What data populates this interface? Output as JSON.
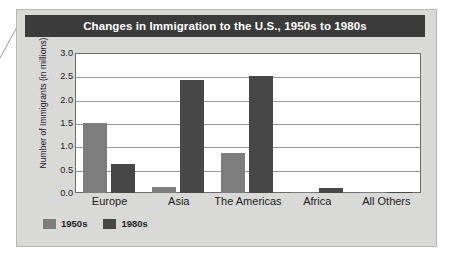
{
  "chart_data": {
    "type": "bar",
    "title": "Changes in Immigration to the U.S., 1950s to 1980s",
    "xlabel": "",
    "ylabel": "Number of Immigrants (in millions)",
    "categories": [
      "Europe",
      "Asia",
      "The Americas",
      "Africa",
      "All Others"
    ],
    "series": [
      {
        "name": "1950s",
        "color": "#7d7d7d",
        "values": [
          1.5,
          0.12,
          0.85,
          0.02,
          0.03
        ]
      },
      {
        "name": "1980s",
        "color": "#474747",
        "values": [
          0.62,
          2.42,
          2.5,
          0.1,
          0.03
        ]
      }
    ],
    "ylim": [
      0.0,
      3.0
    ],
    "ytick_step": 0.5,
    "ytick_labels": [
      "3.0",
      "2.5",
      "2.0",
      "1.5",
      "1.0",
      "0.5",
      "0.0"
    ],
    "grid": true,
    "legend_position": "bottom-left"
  },
  "colors": {
    "panel_background": "#d9d9d7",
    "title_bar_background": "#3b3b3b",
    "title_text": "#ffffff",
    "plot_background": "#ffffff",
    "gridline": "#9a9a9a",
    "axis_border": "#6e6e6e",
    "series_1950s": "#7d7d7d",
    "series_1980s": "#474747"
  },
  "icons": {
    "leader_line": "leader-line"
  }
}
